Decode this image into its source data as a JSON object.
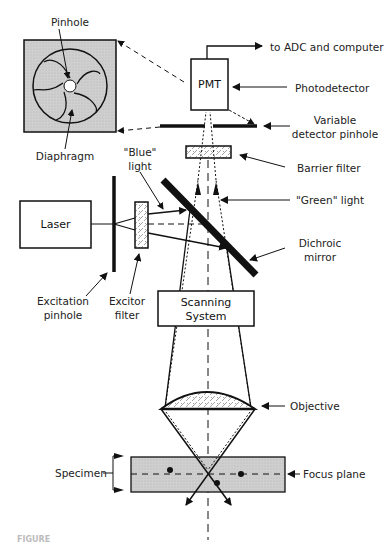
{
  "figure": {
    "caption_fragment": "FIGURE"
  },
  "components": {
    "pmt": "PMT",
    "laser": "Laser",
    "scanning_line1": "Scanning",
    "scanning_line2": "System"
  },
  "labels": {
    "pinhole": "Pinhole",
    "diaphragm": "Diaphragm",
    "to_adc": "to ADC and computer",
    "photodetector": "Photodetector",
    "variable_line1": "Variable",
    "variable_line2": "detector pinhole",
    "barrier_filter": "Barrier filter",
    "blue_line1": "\"Blue\"",
    "blue_line2": "light",
    "green_light": "\"Green\" light",
    "dichroic_line1": "Dichroic",
    "dichroic_line2": "mirror",
    "excitation_line1": "Excitation",
    "excitation_line2": "pinhole",
    "excitor_line1": "Excitor",
    "excitor_line2": "filter",
    "objective": "Objective",
    "specimen": "Specimen",
    "focus_plane": "Focus plane"
  },
  "colors": {
    "line": "#111111",
    "panel_fill": "#c8c8c8",
    "specimen_fill": "#d4d4d4"
  }
}
